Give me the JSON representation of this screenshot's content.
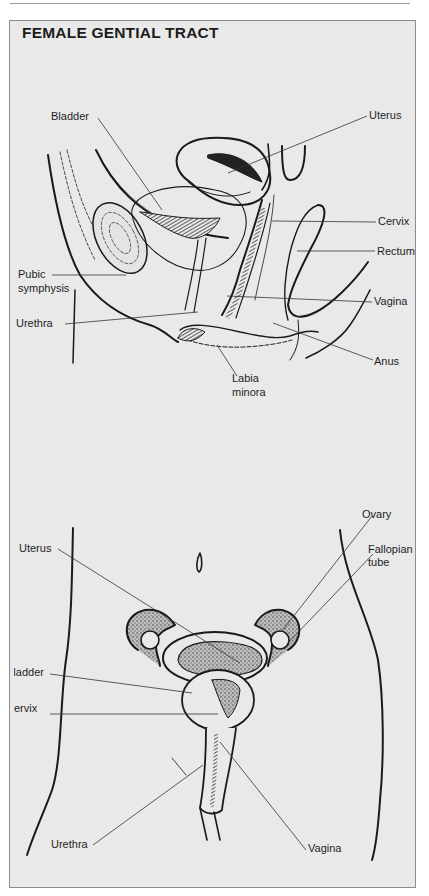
{
  "page": {
    "title": "FEMALE GENTIAL TRACT"
  },
  "sagittal_view": {
    "labels": {
      "bladder": "Bladder",
      "uterus": "Uterus",
      "cervix": "Cervix",
      "rectum": "Rectum",
      "pubic_symphysis_1": "Pubic",
      "pubic_symphysis_2": "symphysis",
      "vagina": "Vagina",
      "urethra": "Urethra",
      "anus": "Anus",
      "labia_minora_1": "Labia",
      "labia_minora_2": "minora"
    }
  },
  "frontal_view": {
    "labels": {
      "ovary": "Ovary",
      "uterus": "Uterus",
      "fallopian_tube_1": "Fallopian",
      "fallopian_tube_2": "tube",
      "bladder": "Bladder",
      "cervix": "Cervix",
      "urethra": "Urethra",
      "vagina": "Vagina"
    }
  },
  "colors": {
    "panel_bg": "#e9e9e9",
    "panel_border": "#8c8c8c",
    "ink": "#1a1a1a"
  }
}
